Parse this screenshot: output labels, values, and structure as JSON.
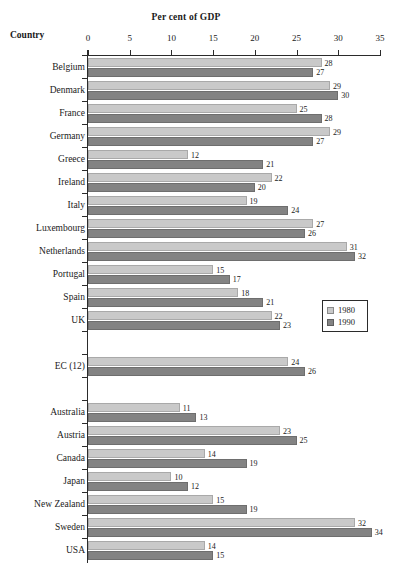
{
  "header": {
    "title": "Per cent of GDP",
    "country_label": "Country"
  },
  "legend": {
    "items": [
      {
        "label": "1980",
        "color": "#c9c9c9"
      },
      {
        "label": "1990",
        "color": "#838383"
      }
    ]
  },
  "chart_data": {
    "type": "bar",
    "orientation": "horizontal",
    "title": "Per cent of GDP",
    "xlabel": "Per cent of GDP",
    "ylabel": "Country",
    "xlim": [
      0,
      35
    ],
    "xticks": [
      0,
      5,
      10,
      15,
      20,
      25,
      30,
      35
    ],
    "xtick_labels": [
      "0",
      "5",
      "10",
      "15",
      "20",
      "25",
      "30",
      "35"
    ],
    "grid": false,
    "legend_position": "right-middle",
    "categories": [
      "Belgium",
      "Denmark",
      "France",
      "Germany",
      "Greece",
      "Ireland",
      "Italy",
      "Luxembourg",
      "Netherlands",
      "Portugal",
      "Spain",
      "UK",
      "EC (12)",
      "Australia",
      "Austria",
      "Canada",
      "Japan",
      "New Zealand",
      "Sweden",
      "USA"
    ],
    "series": [
      {
        "name": "1980",
        "color": "#c9c9c9",
        "values": [
          28,
          29,
          25,
          29,
          12,
          22,
          19,
          27,
          31,
          15,
          18,
          22,
          24,
          11,
          23,
          14,
          10,
          15,
          32,
          14
        ]
      },
      {
        "name": "1990",
        "color": "#838383",
        "values": [
          27,
          30,
          28,
          27,
          21,
          20,
          24,
          26,
          32,
          17,
          21,
          23,
          26,
          13,
          25,
          19,
          12,
          19,
          34,
          15
        ]
      }
    ],
    "group_breaks_after": [
      "UK",
      "EC (12)"
    ]
  }
}
